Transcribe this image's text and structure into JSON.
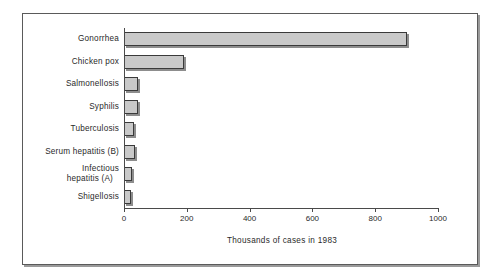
{
  "chart_data": {
    "type": "bar",
    "orientation": "horizontal",
    "title": "",
    "xlabel": "Thousands of cases in 1983",
    "ylabel": "",
    "categories": [
      "Gonorrhea",
      "Chicken pox",
      "Salmonellosis",
      "Syphilis",
      "Tuberculosis",
      "Serum hepatitis (B)",
      "Infectious hepatitis (A)",
      "Shigellosis"
    ],
    "category_lines": [
      [
        "Gonorrhea"
      ],
      [
        "Chicken pox"
      ],
      [
        "Salmonellosis"
      ],
      [
        "Syphilis"
      ],
      [
        "Tuberculosis"
      ],
      [
        "Serum hepatitis (B)"
      ],
      [
        "Infectious",
        "hepatitis (A)"
      ],
      [
        "Shigellosis"
      ]
    ],
    "values": [
      900,
      190,
      45,
      43,
      32,
      34,
      27,
      22
    ],
    "xlim": [
      0,
      1000
    ],
    "xticks": [
      0,
      200,
      400,
      600,
      800,
      1000
    ],
    "xtick_labels": [
      "0",
      "200",
      "400",
      "600",
      "800",
      "1000"
    ],
    "grid": false,
    "legend": false,
    "bar_fill_color": "#c9c9c9",
    "bar_edge_color": "#3a3a3a",
    "frame_color": "#5a5a5a",
    "background_color": "#ffffff"
  }
}
